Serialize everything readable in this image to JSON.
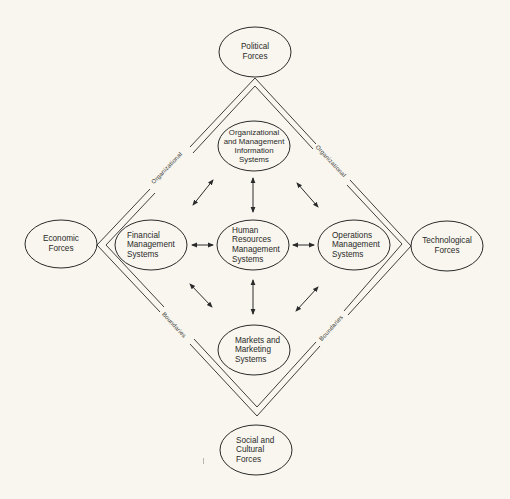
{
  "diagram": {
    "type": "organizational-systems-diamond",
    "colors": {
      "background": "#f8f6ee",
      "ink": "#2a2a2a"
    },
    "external_forces": [
      {
        "id": "political",
        "label": "Political\nForces",
        "position": "top"
      },
      {
        "id": "economic",
        "label": "Economic\nForces",
        "position": "left"
      },
      {
        "id": "technological",
        "label": "Technological\nForces",
        "position": "right"
      },
      {
        "id": "social",
        "label": "Social and\nCultural\nForces",
        "position": "bottom"
      }
    ],
    "internal_systems": [
      {
        "id": "omis",
        "label": "Organizational\nand Management\nInformation\nSystems",
        "position": "top"
      },
      {
        "id": "financial",
        "label": "Financial\nManagement\nSystems",
        "position": "left"
      },
      {
        "id": "hr",
        "label": "Human\nResources\nManagement\nSystems",
        "position": "center"
      },
      {
        "id": "operations",
        "label": "Operations\nManagement\nSystems",
        "position": "right"
      },
      {
        "id": "markets",
        "label": "Markets and\nMarketing\nSystems",
        "position": "bottom"
      }
    ],
    "boundary_labels": {
      "upper_left": "Organizational",
      "upper_right": "Organizational",
      "lower_left": "Boundaries",
      "lower_right": "Boundaries"
    },
    "connections": [
      {
        "from": "hr",
        "to": "omis",
        "type": "bidirectional"
      },
      {
        "from": "hr",
        "to": "financial",
        "type": "bidirectional"
      },
      {
        "from": "hr",
        "to": "operations",
        "type": "bidirectional"
      },
      {
        "from": "hr",
        "to": "markets",
        "type": "bidirectional"
      },
      {
        "from": "financial",
        "to": "omis",
        "type": "bidirectional"
      },
      {
        "from": "omis",
        "to": "operations",
        "type": "bidirectional"
      },
      {
        "from": "financial",
        "to": "markets",
        "type": "bidirectional"
      },
      {
        "from": "markets",
        "to": "operations",
        "type": "bidirectional"
      }
    ]
  }
}
